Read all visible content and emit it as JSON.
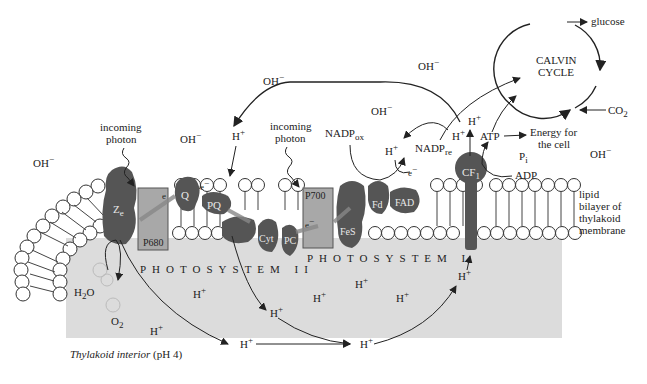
{
  "figure": {
    "interior_label_italic": "Thylakoid interior",
    "interior_label_ph": " (pH 4)",
    "membrane_label": [
      "lipid",
      "bilayer of",
      "thylakoid",
      "membrane"
    ],
    "photosystem2": "PHOTOSYSTEM II",
    "photosystem1": "PHOTOSYSTEM I",
    "calvin": [
      "CALVIN",
      "CYCLE"
    ],
    "glucose": "glucose",
    "co2": "CO",
    "co2_sub": "2",
    "energy": [
      "Energy for",
      "the cell"
    ],
    "atp": "ATP",
    "adp": "ADP",
    "pi": "P",
    "pi_sub": "i",
    "nadp_ox": "NADP",
    "nadp_ox_sub": "ox",
    "nadp_re": "NADP",
    "nadp_re_sub": "re",
    "incoming_photon": [
      "incoming",
      "photon"
    ],
    "proteins": {
      "z": "Z",
      "z_sub": "e",
      "p680": "P680",
      "q": "Q",
      "pq": "PQ",
      "cyt": "Cyt",
      "pc": "PC",
      "p700": "P700",
      "fes": "FeS",
      "fd": "Fd",
      "fad": "FAD",
      "cf1": "CF",
      "cf1_sub": "1"
    },
    "ions": {
      "oh": "OH",
      "h": "H",
      "plus": "+",
      "minus": "−",
      "e": "e",
      "h2o": "H",
      "h2o_sub": "2",
      "h2o_o": "O",
      "o2": "O",
      "o2_sub": "2"
    }
  }
}
